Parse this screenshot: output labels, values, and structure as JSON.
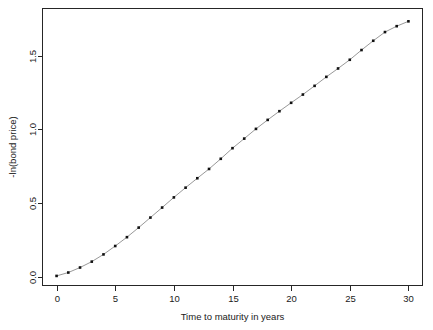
{
  "chart_data": {
    "type": "line",
    "title": "",
    "subtitle": "",
    "xlabel": "Time to maturity in years",
    "ylabel": "-ln(bond price)",
    "xlim": [
      -1.2,
      31.2
    ],
    "ylim": [
      -0.06,
      1.82
    ],
    "xticks": [
      0,
      5,
      10,
      15,
      20,
      25,
      30
    ],
    "xticklabels": [
      "0",
      "5",
      "10",
      "15",
      "20",
      "25",
      "30"
    ],
    "yticks": [
      0.0,
      0.5,
      1.0,
      1.5
    ],
    "yticklabels": [
      "0.0",
      "0.5",
      "1.0",
      "1.5"
    ],
    "grid": false,
    "legend": false,
    "legend_position": "none",
    "marker": "filled-square",
    "marker_color": "#111111",
    "line_color": "#8c8c8c",
    "frame_color": "#262626",
    "x": [
      0,
      1,
      2,
      3,
      4,
      5,
      6,
      7,
      8,
      9,
      10,
      11,
      12,
      13,
      14,
      15,
      16,
      17,
      18,
      19,
      20,
      21,
      22,
      23,
      24,
      25,
      26,
      27,
      28,
      29,
      30
    ],
    "values": [
      0.005,
      0.028,
      0.062,
      0.102,
      0.151,
      0.208,
      0.268,
      0.333,
      0.401,
      0.469,
      0.538,
      0.604,
      0.668,
      0.731,
      0.8,
      0.872,
      0.937,
      1.003,
      1.064,
      1.123,
      1.18,
      1.236,
      1.295,
      1.356,
      1.413,
      1.472,
      1.538,
      1.601,
      1.66,
      1.7,
      1.733
    ],
    "series": [
      {
        "name": "-ln(bond price)",
        "values": [
          0.005,
          0.028,
          0.062,
          0.102,
          0.151,
          0.208,
          0.268,
          0.333,
          0.401,
          0.469,
          0.538,
          0.604,
          0.668,
          0.731,
          0.8,
          0.872,
          0.937,
          1.003,
          1.064,
          1.123,
          1.18,
          1.236,
          1.295,
          1.356,
          1.413,
          1.472,
          1.538,
          1.601,
          1.66,
          1.7,
          1.733
        ]
      }
    ],
    "annotations": []
  }
}
